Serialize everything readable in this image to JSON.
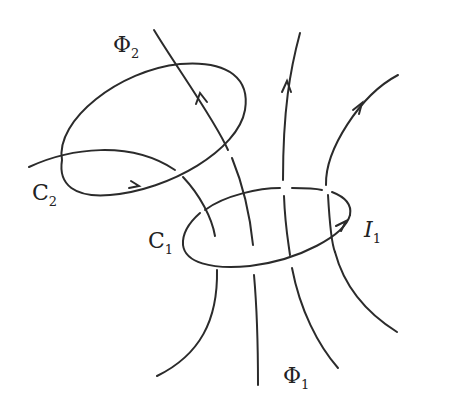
{
  "diagram": {
    "labels": {
      "phi2": {
        "symbol": "Φ",
        "subscript": "2"
      },
      "phi1": {
        "symbol": "Φ",
        "subscript": "1"
      },
      "c2": {
        "symbol": "C",
        "subscript": "2"
      },
      "c1": {
        "symbol": "C",
        "subscript": "1"
      },
      "i1": {
        "symbol": "I",
        "subscript": "1"
      }
    },
    "loops": [
      {
        "name": "C1",
        "role": "source loop carrying current I1"
      },
      {
        "name": "C2",
        "role": "secondary loop linked by flux Φ2"
      }
    ],
    "flux_lines": 4,
    "colors": {
      "stroke": "#2b2b2b",
      "background": "#ffffff"
    }
  }
}
